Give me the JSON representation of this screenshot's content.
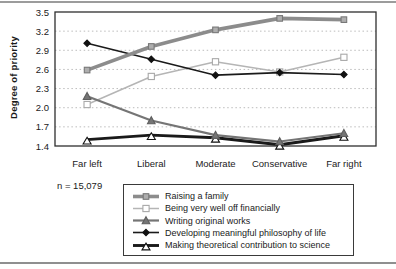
{
  "chart_data": {
    "type": "line",
    "title": "",
    "ylabel": "Degree of priority",
    "xlabel": "",
    "categories": [
      "Far left",
      "Liberal",
      "Moderate",
      "Conservative",
      "Far right"
    ],
    "yticks": [
      1.4,
      1.7,
      2.0,
      2.3,
      2.6,
      2.9,
      3.2,
      3.5
    ],
    "ylim": [
      1.4,
      3.5
    ],
    "grid": "horizontal-dotted",
    "legend_position": "bottom-center-boxed",
    "annotation": "n = 15,079",
    "series": [
      {
        "name": "Raising a family",
        "values": [
          2.59,
          2.96,
          3.22,
          3.4,
          3.38
        ],
        "color": "#8c8c8c",
        "line_width": 3.6,
        "marker": "square-filled",
        "marker_fill": "#aeaeae",
        "marker_stroke": "#787878"
      },
      {
        "name": "Being very well off financially",
        "values": [
          2.05,
          2.49,
          2.72,
          2.56,
          2.79
        ],
        "color": "#b5b5b5",
        "line_width": 1.5,
        "marker": "square-open",
        "marker_fill": "#ffffff",
        "marker_stroke": "#a8a8a8"
      },
      {
        "name": "Writing original works",
        "values": [
          2.18,
          1.8,
          1.57,
          1.47,
          1.6
        ],
        "color": "#757575",
        "line_width": 2.2,
        "marker": "triangle-filled",
        "marker_fill": "#757575",
        "marker_stroke": "#5e5e5e"
      },
      {
        "name": "Developing meaningful philosophy of life",
        "values": [
          3.01,
          2.76,
          2.51,
          2.55,
          2.52
        ],
        "color": "#1a1a1a",
        "line_width": 1.6,
        "marker": "diamond-filled",
        "marker_fill": "#111111",
        "marker_stroke": "#111111"
      },
      {
        "name": "Making theoretical contribution to science",
        "values": [
          1.5,
          1.57,
          1.53,
          1.42,
          1.56
        ],
        "color": "#1a1a1a",
        "line_width": 2.9,
        "marker": "triangle-open",
        "marker_fill": "#ffffff",
        "marker_stroke": "#111111"
      }
    ],
    "colors": {
      "plot_border": "#2e2e2e",
      "gridline": "#bcbcbc",
      "top_rule": "#9c9c9c",
      "bottom_rule": "#8f8f8f",
      "text": "#1a1a1a"
    }
  }
}
